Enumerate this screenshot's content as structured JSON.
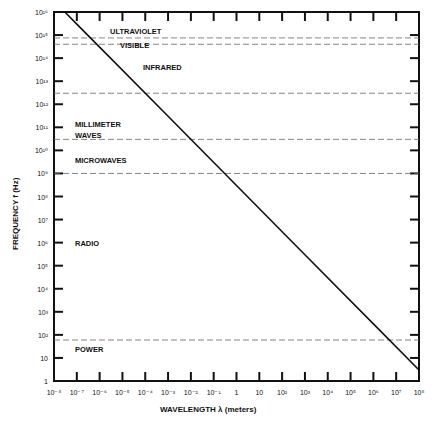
{
  "chart_data": {
    "type": "line",
    "title": "",
    "xlabel": "WAVELENGTH λ (meters)",
    "ylabel": "FREQUENCY f (Hz)",
    "xscale": "log",
    "yscale": "log",
    "xlim": [
      1e-08,
      100000000.0
    ],
    "ylim": [
      1,
      1e+16
    ],
    "grid": false,
    "x_tick_labels": [
      "10⁻⁸",
      "10⁻⁷",
      "10⁻⁶",
      "10⁻⁵",
      "10⁻⁴",
      "10⁻³",
      "10⁻²",
      "10⁻¹",
      "1",
      "10",
      "10²",
      "10³",
      "10⁴",
      "10⁵",
      "10⁶",
      "10⁷",
      "10⁸"
    ],
    "y_tick_labels": [
      "1",
      "10",
      "10²",
      "10³",
      "10⁴",
      "10⁵",
      "10⁶",
      "10⁷",
      "10⁸",
      "10⁹",
      "10¹⁰",
      "10¹¹",
      "10¹²",
      "10¹³",
      "10¹⁴",
      "10¹⁵",
      "10¹⁶"
    ],
    "series": [
      {
        "name": "f = c / λ",
        "x": [
          3e-08,
          1e-07,
          1e-06,
          0.001,
          1,
          1000.0,
          1000000.0,
          100000000.0
        ],
        "y": [
          1e+16,
          3000000000000000.0,
          300000000000000.0,
          300000000000.0,
          300000000.0,
          300000.0,
          300,
          3
        ]
      }
    ],
    "band_boundaries_hz": [
      750000000000000.0,
      400000000000000.0,
      3000000000000.0,
      30000000000.0,
      1000000000.0,
      60
    ],
    "bands": [
      {
        "name": "ULTRAVIOLET",
        "label_freq": 1000000000000000.0
      },
      {
        "name": "VISIBLE",
        "label_freq": 550000000000000.0
      },
      {
        "name": "INFRARED",
        "label_freq": 30000000000000.0
      },
      {
        "name": "MILLIMETER WAVES",
        "label_freq": 100000000000.0
      },
      {
        "name": "MICROWAVES",
        "label_freq": 5000000000.0
      },
      {
        "name": "RADIO",
        "label_freq": 1000000.0
      },
      {
        "name": "POWER",
        "label_freq": 20
      }
    ]
  },
  "labels": {
    "xlabel": "WAVELENGTH λ (meters)",
    "ylabel": "FREQUENCY f (Hz)",
    "uv": "ULTRAVIOLET",
    "visible": "VISIBLE",
    "infrared": "INFRARED",
    "mm1": "MILLIMETER",
    "mm2": "WAVES",
    "microwaves": "MICROWAVES",
    "radio": "RADIO",
    "power": "POWER"
  }
}
